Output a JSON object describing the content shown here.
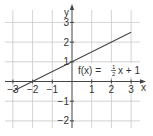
{
  "chart_data": {
    "type": "line",
    "title": "",
    "xlabel": "x",
    "ylabel": "y",
    "xlim": [
      -3.4,
      3.6
    ],
    "ylim": [
      -2.4,
      3.6
    ],
    "grid": true,
    "x_ticks": [
      -3,
      -2,
      -1,
      1,
      2,
      3
    ],
    "y_ticks": [
      -2,
      -1,
      1,
      2,
      3
    ],
    "x_tick_labels": [
      "−3",
      "−2",
      "−1",
      "1",
      "2",
      "3"
    ],
    "y_tick_labels": [
      "−2",
      "−1",
      "1",
      "2",
      "3"
    ],
    "series": [
      {
        "name": "f(x) = 1/2 x + 1",
        "slope": 0.5,
        "intercept": 1,
        "x": [
          -3,
          -2,
          -1,
          0,
          1,
          2,
          3
        ],
        "y": [
          -0.5,
          0,
          0.5,
          1,
          1.5,
          2,
          2.5
        ]
      }
    ],
    "annotations": [
      {
        "text": "f(x) = ½x + 1",
        "x": 0.1,
        "y": 0.7
      }
    ],
    "legend": "none"
  },
  "labels": {
    "x_axis": "x",
    "y_axis": "y",
    "formula_lhs": "f(x) =",
    "formula_num": "1",
    "formula_den": "2",
    "formula_rhs": "x + 1"
  },
  "colors": {
    "grid": "#c8c8c8",
    "axis": "#444444",
    "line": "#444444",
    "text": "#333333"
  }
}
